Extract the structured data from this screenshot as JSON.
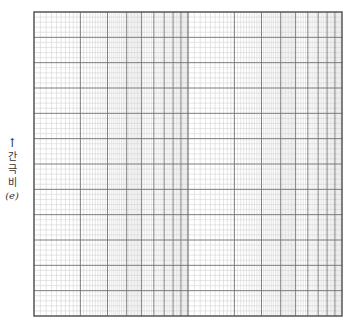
{
  "chart_data": {
    "type": "semi-log graph paper (blank)",
    "title": "",
    "xlabel": "",
    "ylabel": "간극비 (e)",
    "x_axis": {
      "scale": "log",
      "cycles": 2,
      "tick_labels": []
    },
    "y_axis": {
      "scale": "linear",
      "major_divisions": 12,
      "minor_per_major": 5,
      "tick_labels": []
    },
    "grid": true,
    "series": []
  },
  "ylabel": {
    "arrow": "↑",
    "chars": [
      "간",
      "극",
      "비"
    ],
    "symbol": "(e)"
  },
  "colors": {
    "major_line": "#6e6e6e",
    "minor_line": "#d4d4d4",
    "frame": "#555555"
  }
}
